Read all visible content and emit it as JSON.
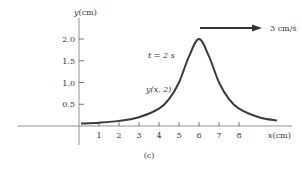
{
  "chart_data": {
    "type": "line",
    "title": "",
    "panel_label": "(c)",
    "xlabel": "x(cm)",
    "xlabel_var": "x",
    "xlabel_unit": "(cm)",
    "ylabel": "y(cm)",
    "ylabel_var": "y",
    "ylabel_unit": "(cm)",
    "xlim": [
      0,
      10.5
    ],
    "ylim": [
      0,
      2.4
    ],
    "x_ticks": [
      1,
      2,
      3,
      4,
      5,
      6,
      7,
      8
    ],
    "x_tick_labels": [
      "1",
      "2",
      "3",
      "4",
      "5",
      "6",
      "7",
      "8"
    ],
    "y_ticks": [
      0.5,
      1.0,
      1.5,
      2.0
    ],
    "y_tick_labels": [
      "0.5",
      "1.0",
      "1.5",
      "2.0"
    ],
    "grid": false,
    "series": [
      {
        "name": "y(x, 2)",
        "x": [
          0.1,
          1,
          2,
          3,
          4,
          4.5,
          5,
          5.5,
          6,
          6.5,
          7,
          7.5,
          8,
          9,
          9.9
        ],
        "y": [
          0.056,
          0.077,
          0.118,
          0.2,
          0.4,
          0.62,
          1.0,
          1.6,
          2.0,
          1.6,
          1.0,
          0.62,
          0.4,
          0.2,
          0.124
        ]
      }
    ],
    "annotations": {
      "time_label": "t = 2 s",
      "curve_label": "y(x, 2)",
      "velocity_label": "3 cm/s",
      "velocity_direction": "right"
    }
  }
}
